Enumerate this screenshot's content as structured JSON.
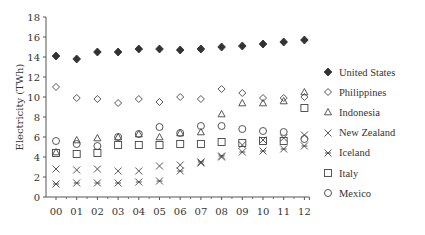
{
  "chart_data": {
    "type": "scatter",
    "title": "",
    "xlabel": "",
    "ylabel": "Electricity (TWh)",
    "ylim": [
      0,
      18
    ],
    "yticks": [
      0,
      2,
      4,
      6,
      8,
      10,
      12,
      14,
      16,
      18
    ],
    "categories": [
      "00",
      "01",
      "02",
      "03",
      "04",
      "05",
      "06",
      "07",
      "08",
      "09",
      "10",
      "11",
      "12"
    ],
    "grid": false,
    "legend_position": "right",
    "series": [
      {
        "name": "United States",
        "marker": "filled-diamond",
        "values": [
          14.1,
          13.8,
          14.5,
          14.5,
          14.8,
          14.8,
          14.7,
          14.8,
          15.0,
          15.1,
          15.3,
          15.5,
          15.7
        ]
      },
      {
        "name": "Philippines",
        "marker": "open-diamond",
        "values": [
          11.0,
          9.9,
          9.8,
          9.4,
          9.8,
          9.5,
          10.0,
          9.8,
          10.8,
          10.4,
          9.9,
          9.9,
          10.0
        ]
      },
      {
        "name": "Indonesia",
        "marker": "triangle",
        "values": [
          4.5,
          5.7,
          5.9,
          6.0,
          6.3,
          6.0,
          6.4,
          6.5,
          8.3,
          9.4,
          9.4,
          9.6,
          10.5
        ]
      },
      {
        "name": "New Zealand",
        "marker": "x",
        "values": [
          2.8,
          2.7,
          2.8,
          2.6,
          2.6,
          3.1,
          3.2,
          3.4,
          4.0,
          5.2,
          5.7,
          5.9,
          6.2
        ]
      },
      {
        "name": "Iceland",
        "marker": "asterisk",
        "values": [
          1.3,
          1.4,
          1.4,
          1.4,
          1.5,
          1.6,
          2.6,
          3.5,
          4.1,
          4.5,
          4.6,
          4.8,
          5.1
        ]
      },
      {
        "name": "Italy",
        "marker": "square",
        "values": [
          4.4,
          4.3,
          4.4,
          5.2,
          5.2,
          5.2,
          5.3,
          5.3,
          5.5,
          5.4,
          5.6,
          5.6,
          8.9
        ]
      },
      {
        "name": "Mexico",
        "marker": "circle",
        "values": [
          5.6,
          5.3,
          5.1,
          6.0,
          6.3,
          7.0,
          6.4,
          7.1,
          7.1,
          6.8,
          6.6,
          6.5,
          5.8
        ]
      }
    ]
  },
  "legend": {
    "items": [
      {
        "label": "United States",
        "icon": "filled-diamond-icon"
      },
      {
        "label": "Philippines",
        "icon": "open-diamond-icon"
      },
      {
        "label": "Indonesia",
        "icon": "triangle-icon"
      },
      {
        "label": "New Zealand",
        "icon": "x-icon"
      },
      {
        "label": "Iceland",
        "icon": "asterisk-icon"
      },
      {
        "label": "Italy",
        "icon": "square-icon"
      },
      {
        "label": "Mexico",
        "icon": "circle-icon"
      }
    ]
  },
  "colors": {
    "marker": "#444444",
    "axis": "#555555",
    "text": "#333333"
  }
}
